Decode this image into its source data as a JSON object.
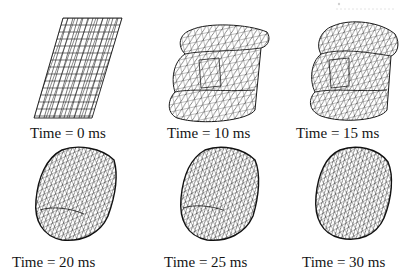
{
  "figure": {
    "type": "mesh-deformation-sequence",
    "panels": [
      {
        "id": "t0",
        "time_ms": 0,
        "caption": "Time = 0 ms",
        "shape": "flat-parallelogram-mesh"
      },
      {
        "id": "t10",
        "time_ms": 10,
        "caption": "Time = 10 ms",
        "shape": "partially-inflated-folded-mesh"
      },
      {
        "id": "t15",
        "time_ms": 15,
        "caption": "Time = 15 ms",
        "shape": "partially-inflated-folded-mesh"
      },
      {
        "id": "t20",
        "time_ms": 20,
        "caption": "Time = 20 ms",
        "shape": "inflated-ellipsoid-mesh"
      },
      {
        "id": "t25",
        "time_ms": 25,
        "caption": "Time = 25 ms",
        "shape": "inflated-ellipsoid-mesh"
      },
      {
        "id": "t30",
        "time_ms": 30,
        "caption": "Time = 30 ms",
        "shape": "fully-inflated-ellipsoid-mesh"
      }
    ],
    "layout": {
      "rows": 2,
      "cols": 3
    },
    "colors": {
      "background": "#ffffff",
      "mesh": "#1a1a1a",
      "text": "#151515"
    }
  }
}
